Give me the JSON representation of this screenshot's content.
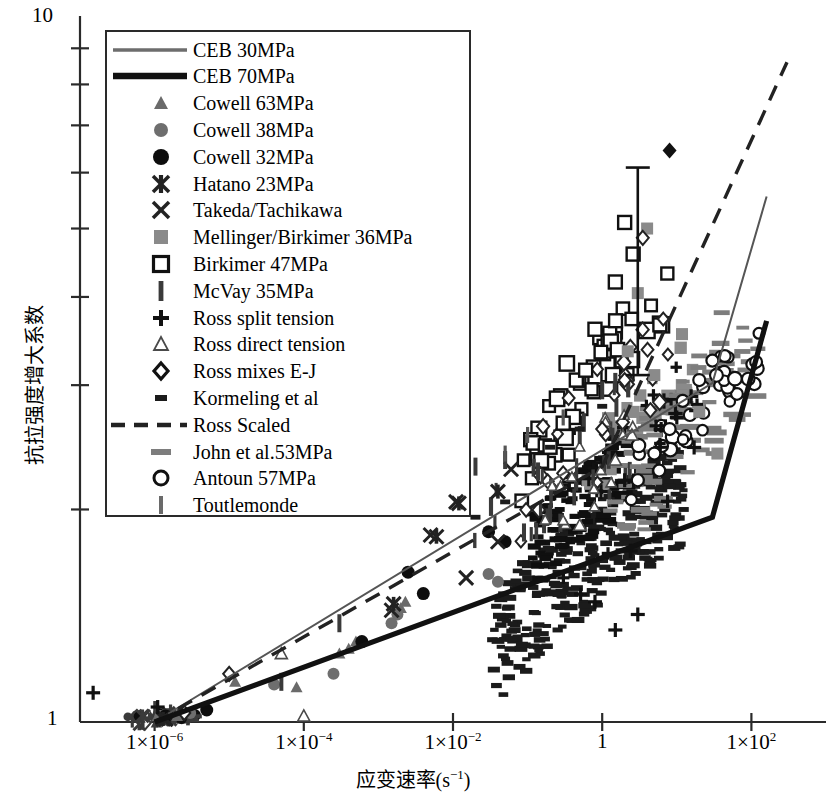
{
  "chart_data": {
    "type": "scatter",
    "title": "",
    "xlabel": "应变速率(s⁻¹)",
    "ylabel": "抗拉强度增大系数",
    "xscale": "log",
    "yscale": "log",
    "xlim": [
      1e-07,
      1000
    ],
    "ylim": [
      1,
      10
    ],
    "grid": false,
    "legend_position": "upper-left",
    "x_tick_labels": [
      "1×10⁻⁶",
      "1×10⁻⁴",
      "1×10⁻²",
      "1",
      "1×10²"
    ],
    "x_tick_values": [
      1e-06,
      0.0001,
      0.01,
      1,
      100
    ],
    "y_tick_labels": [
      "1",
      "10"
    ],
    "y_tick_values": [
      1,
      10
    ],
    "y_minor_ticks": [
      2,
      3,
      4,
      5,
      6,
      7,
      8,
      9
    ],
    "series": [
      {
        "name": "CEB 30MPa",
        "marker": "line-thin",
        "color": "#555555",
        "points": [
          [
            1e-06,
            1.0
          ],
          [
            30.0,
            3.02
          ],
          [
            160.0,
            5.55
          ]
        ]
      },
      {
        "name": "CEB 70MPa",
        "marker": "line-thick",
        "color": "#111111",
        "points": [
          [
            1e-06,
            1.0
          ],
          [
            30.0,
            1.95
          ],
          [
            160.0,
            3.7
          ]
        ]
      },
      {
        "name": "Cowell 63MPa",
        "marker": "triangle-filled",
        "color": "#6a6a6a",
        "points": [
          [
            1.1e-06,
            1.02
          ],
          [
            2e-06,
            1.02
          ],
          [
            1.2e-05,
            1.14
          ],
          [
            8e-05,
            1.12
          ],
          [
            0.0003,
            1.25
          ],
          [
            0.0005,
            1.3
          ],
          [
            0.0004,
            1.27
          ],
          [
            0.002,
            1.45
          ],
          [
            0.0023,
            1.48
          ]
        ]
      },
      {
        "name": "Cowell 38MPa",
        "marker": "circle-gray",
        "color": "#6e6e6e",
        "points": [
          [
            1.2e-06,
            1.02
          ],
          [
            3e-06,
            1.03
          ],
          [
            4e-05,
            1.13
          ],
          [
            0.00025,
            1.17
          ],
          [
            0.0015,
            1.38
          ],
          [
            0.0018,
            1.42
          ],
          [
            0.03,
            1.62
          ],
          [
            0.04,
            1.58
          ]
        ]
      },
      {
        "name": "Cowell 32MPa",
        "marker": "circle-black",
        "color": "#111111",
        "points": [
          [
            1.4e-06,
            1.02
          ],
          [
            5e-06,
            1.04
          ],
          [
            0.0006,
            1.3
          ],
          [
            0.0025,
            1.63
          ],
          [
            0.004,
            1.52
          ],
          [
            0.03,
            1.86
          ],
          [
            0.05,
            1.8
          ]
        ]
      },
      {
        "name": "Hatano 23MPa",
        "marker": "star-x",
        "color": "#222222",
        "points": [
          [
            1.3e-06,
            1.01
          ],
          [
            0.0016,
            1.47
          ],
          [
            0.006,
            1.83
          ],
          [
            0.012,
            2.04
          ],
          [
            0.04,
            2.12
          ]
        ]
      },
      {
        "name": "Takeda/Tachikawa",
        "marker": "x-cross",
        "color": "#222222",
        "points": [
          [
            1.4e-06,
            1.01
          ],
          [
            0.0015,
            1.44
          ],
          [
            0.005,
            1.84
          ],
          [
            0.011,
            2.05
          ],
          [
            0.06,
            2.28
          ],
          [
            0.04,
            1.8
          ],
          [
            0.015,
            1.6
          ]
        ]
      },
      {
        "name": "Mellinger/Birkimer 36MPa",
        "marker": "square-gray",
        "color": "#8a8a8a",
        "points": [
          [
            3,
            4.05
          ],
          [
            4,
            5.0
          ],
          [
            2.2,
            3.35
          ],
          [
            5,
            3.1
          ],
          [
            12,
            2.9
          ],
          [
            20,
            2.75
          ],
          [
            35,
            2.4
          ]
        ]
      },
      {
        "name": "Birkimer 47MPa",
        "marker": "square-open",
        "color": "#111111",
        "points": [
          [
            0.8,
            3.6
          ],
          [
            1.5,
            4.2
          ],
          [
            2.0,
            5.1
          ],
          [
            2.6,
            4.6
          ],
          [
            0.45,
            3.05
          ],
          [
            0.6,
            3.15
          ],
          [
            0.3,
            2.65
          ],
          [
            0.2,
            2.45
          ]
        ]
      },
      {
        "name": "McVay 35MPa",
        "marker": "bar-vert",
        "color": "#3a3a3a",
        "points": [
          [
            0.0003,
            1.38
          ],
          [
            5e-05,
            1.14
          ],
          [
            0.02,
            2.3
          ],
          [
            0.05,
            2.35
          ],
          [
            0.5,
            2.55
          ],
          [
            1.0,
            2.95
          ]
        ]
      },
      {
        "name": "Ross split tension",
        "marker": "plus",
        "color": "#111111",
        "points": [
          [
            1.1e-06,
            1.05
          ],
          [
            1.5e-07,
            1.1
          ],
          [
            2,
            2.2
          ],
          [
            6,
            2.45
          ],
          [
            10,
            2.7
          ],
          [
            0.8,
            1.48
          ],
          [
            3,
            1.42
          ],
          [
            1.5,
            1.35
          ]
        ]
      },
      {
        "name": "Ross direct tension",
        "marker": "triangle-open",
        "color": "#4a4a4a",
        "points": [
          [
            5e-05,
            1.25
          ],
          [
            0.0001,
            1.02
          ],
          [
            0.5,
            1.9
          ],
          [
            1.5,
            2.35
          ],
          [
            2.5,
            2.55
          ]
        ]
      },
      {
        "name": "Ross mixes E-J",
        "marker": "diamond-open",
        "color": "#222222",
        "points": [
          [
            1e-05,
            1.17
          ],
          [
            2.5e-06,
            1.03
          ],
          [
            0.3,
            2.25
          ],
          [
            1.0,
            2.6
          ],
          [
            2.0,
            3.05
          ],
          [
            3.5,
            4.85
          ]
        ]
      },
      {
        "name": "Kormeling et al",
        "marker": "dash-small",
        "color": "#1b1b1b",
        "points": [
          [
            0.2,
            2.45
          ],
          [
            0.5,
            2.6
          ],
          [
            1.0,
            2.8
          ],
          [
            0.05,
            2.05
          ],
          [
            0.02,
            1.95
          ]
        ]
      },
      {
        "name": "Ross Scaled",
        "marker": "line-dashed",
        "color": "#222222",
        "points": [
          [
            1e-06,
            1.0
          ],
          [
            1.0,
            2.3
          ],
          [
            300.0,
            8.6
          ]
        ]
      },
      {
        "name": "John et al.53MPa",
        "marker": "dash-gray",
        "color": "#7d7d7d",
        "points": [
          [
            5,
            2.55
          ],
          [
            10,
            2.9
          ],
          [
            20,
            3.3
          ],
          [
            40,
            3.8
          ],
          [
            3,
            2.3
          ],
          [
            1.5,
            2.05
          ]
        ]
      },
      {
        "name": "Antoun 57MPa",
        "marker": "circle-open",
        "color": "#111111",
        "points": [
          [
            8,
            2.6
          ],
          [
            12,
            2.85
          ],
          [
            20,
            3.05
          ],
          [
            30,
            3.25
          ],
          [
            5,
            2.4
          ],
          [
            3,
            2.2
          ]
        ]
      },
      {
        "name": "Toutlemonde",
        "marker": "bar-thin",
        "color": "#555555",
        "points": [
          [
            0.05,
            2.4
          ],
          [
            0.1,
            2.55
          ],
          [
            0.3,
            2.7
          ]
        ]
      }
    ],
    "annotations": [
      {
        "type": "errorbar",
        "x": 3.0,
        "y_center": 4.35,
        "y_low": 3.1,
        "y_high": 6.1
      },
      {
        "type": "marker",
        "shape": "diamond-filled",
        "x": 8.0,
        "y": 6.45
      }
    ]
  },
  "axis": {
    "y_top_label": "10",
    "y_bottom_label": "1",
    "x_labels": [
      {
        "mantissa": "1×10",
        "exp": "−6"
      },
      {
        "mantissa": "1×10",
        "exp": "−4"
      },
      {
        "mantissa": "1×10",
        "exp": "−2"
      },
      {
        "mantissa": "1",
        "exp": ""
      },
      {
        "mantissa": "1×10",
        "exp": "2"
      }
    ],
    "xlabel_main": "应变速率(s",
    "xlabel_exp": "−1",
    "xlabel_tail": ")",
    "ylabel_text": "抗拉强度增大系数"
  },
  "legend": {
    "items": [
      {
        "label": "CEB 30MPa",
        "key": "line-thin"
      },
      {
        "label": "CEB 70MPa",
        "key": "line-thick"
      },
      {
        "label": "Cowell 63MPa",
        "key": "triangle-filled"
      },
      {
        "label": "Cowell 38MPa",
        "key": "circle-gray"
      },
      {
        "label": "Cowell 32MPa",
        "key": "circle-black"
      },
      {
        "label": "Hatano 23MPa",
        "key": "star-x"
      },
      {
        "label": "Takeda/Tachikawa",
        "key": "x-cross"
      },
      {
        "label": "Mellinger/Birkimer 36MPa",
        "key": "square-gray"
      },
      {
        "label": "Birkimer 47MPa",
        "key": "square-open"
      },
      {
        "label": "McVay 35MPa",
        "key": "bar-vert"
      },
      {
        "label": "Ross split tension",
        "key": "plus"
      },
      {
        "label": "Ross direct tension",
        "key": "triangle-open"
      },
      {
        "label": "Ross mixes E-J",
        "key": "diamond-open"
      },
      {
        "label": "Kormeling et al",
        "key": "dash-small"
      },
      {
        "label": "Ross Scaled",
        "key": "line-dashed"
      },
      {
        "label": "John et al.53MPa",
        "key": "dash-gray"
      },
      {
        "label": "Antoun 57MPa",
        "key": "circle-open"
      },
      {
        "label": "Toutlemonde",
        "key": "bar-thin"
      }
    ]
  },
  "colors": {
    "axis": "#2a2a2a",
    "ceb30": "#555555",
    "ceb70": "#111111",
    "ross_scaled": "#222222",
    "gray_marker": "#8a8a8a",
    "dark_marker": "#1b1b1b"
  }
}
